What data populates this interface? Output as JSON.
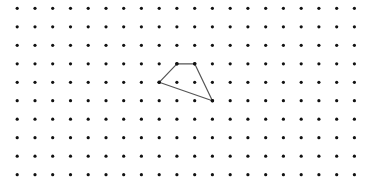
{
  "diagram": {
    "type": "dot-grid-polygon",
    "grid": {
      "columns": 20,
      "rows": 10,
      "origin_x": 17.2,
      "origin_y": 8.3,
      "spacing_x": 17.75,
      "spacing_y": 18.49,
      "dot_radius": 1.6,
      "dot_color": "#111111"
    },
    "polygon": {
      "vertices_grid": [
        [
          8,
          4
        ],
        [
          9,
          3
        ],
        [
          10,
          3
        ],
        [
          11,
          5
        ]
      ],
      "stroke_color": "#555555",
      "stroke_width": 1.2,
      "vertex_dot_color": "#111111"
    },
    "background": "#ffffff"
  }
}
